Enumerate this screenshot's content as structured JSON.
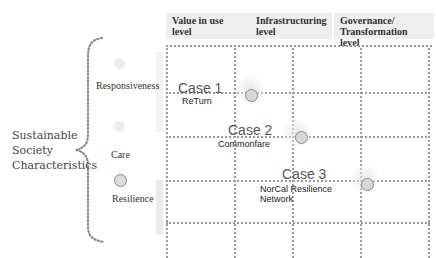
{
  "columns": [
    {
      "line1": "Value in use",
      "line2": "level"
    },
    {
      "line1": "Infrastructuring",
      "line2": "level"
    },
    {
      "line1": "Governance/",
      "line2": "Transformation level"
    }
  ],
  "main_label": {
    "line1": "Sustainable",
    "line2": "Society",
    "line3": "Characteristics"
  },
  "characteristics": [
    {
      "label": "Responsiveness",
      "marker": "faint"
    },
    {
      "label": "Care",
      "marker": "faint"
    },
    {
      "label": "Resilience",
      "marker": "circle"
    }
  ],
  "cases": [
    {
      "title": "Case 1",
      "name_line1": "ReTurn",
      "name_line2": "",
      "level": "Value in use level / Infrastructuring level boundary",
      "characteristic": "Responsiveness"
    },
    {
      "title": "Case 2",
      "name_line1": "Commonfare",
      "name_line2": "",
      "level": "Infrastructuring level",
      "characteristic": "Care"
    },
    {
      "title": "Case 3",
      "name_line1": "NorCal Resilience",
      "name_line2": "Network",
      "level": "Governance/Transformation level boundary",
      "characteristic": "Resilience"
    }
  ],
  "colors": {
    "header_bg": "#eeeeee",
    "grid_line": "#9a9a9a",
    "marker_fill": "#d8d8d8",
    "marker_stroke": "#888888"
  }
}
